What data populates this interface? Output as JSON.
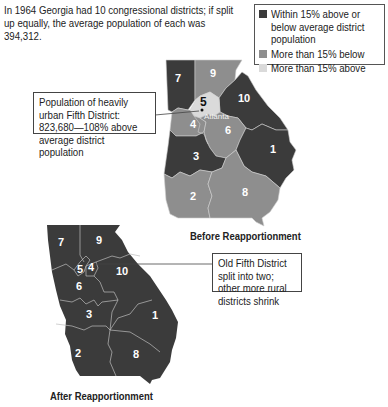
{
  "intro_text": "In 1964 Georgia had 10 congressional districts; if split up equally, the average population of each was 394,312.",
  "legend": {
    "items": [
      {
        "label": "Within 15% above or below average district population",
        "color": "#3b3b3b"
      },
      {
        "label": "More than 15% below",
        "color": "#8e8e8e"
      },
      {
        "label": "More than 15% above",
        "color": "#dadada"
      }
    ]
  },
  "maps": {
    "before": {
      "title": "Before Reapportionment",
      "districts": [
        {
          "number": "1",
          "category": "Within 15% above or below average district population"
        },
        {
          "number": "2",
          "category": "More than 15% below"
        },
        {
          "number": "3",
          "category": "Within 15% above or below average district population"
        },
        {
          "number": "4",
          "category": "More than 15% below"
        },
        {
          "number": "5",
          "category": "More than 15% above"
        },
        {
          "number": "6",
          "category": "More than 15% below"
        },
        {
          "number": "7",
          "category": "Within 15% above or below average district population"
        },
        {
          "number": "8",
          "category": "More than 15% below"
        },
        {
          "number": "9",
          "category": "More than 15% below"
        },
        {
          "number": "10",
          "category": "Within 15% above or below average district population"
        }
      ],
      "city_label": "Atlanta",
      "callout": "Population of heavily urban Fifth District: 823,680—108% above average district population"
    },
    "after": {
      "title": "After Reapportionment",
      "districts": [
        "1",
        "2",
        "3",
        "4",
        "5",
        "6",
        "7",
        "8",
        "9",
        "10"
      ],
      "callout": "Old Fifth District split into two; other more rural districts shrink"
    }
  }
}
